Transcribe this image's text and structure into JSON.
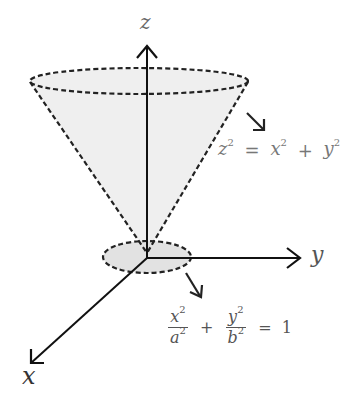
{
  "diagram": {
    "axes": {
      "z": {
        "label": "z"
      },
      "y": {
        "label": "y"
      },
      "x": {
        "label": "x"
      }
    },
    "annotations": {
      "cone_equation": {
        "lhs": "z",
        "lhs_exp": "2",
        "eq": "=",
        "t1": "x",
        "t1_exp": "2",
        "plus": "+",
        "t2": "y",
        "t2_exp": "2"
      },
      "ellipse_equation": {
        "num1": "x",
        "num1_exp": "2",
        "den1": "a",
        "den1_exp": "2",
        "plus": "+",
        "num2": "y",
        "num2_exp": "2",
        "den2": "b",
        "den2_exp": "2",
        "eq": "=",
        "rhs": "1"
      }
    },
    "colors": {
      "stroke": "#222222",
      "cone_fill": "#ececec",
      "ellipse_fill": "#e2e2e2",
      "text": "#555555"
    }
  }
}
